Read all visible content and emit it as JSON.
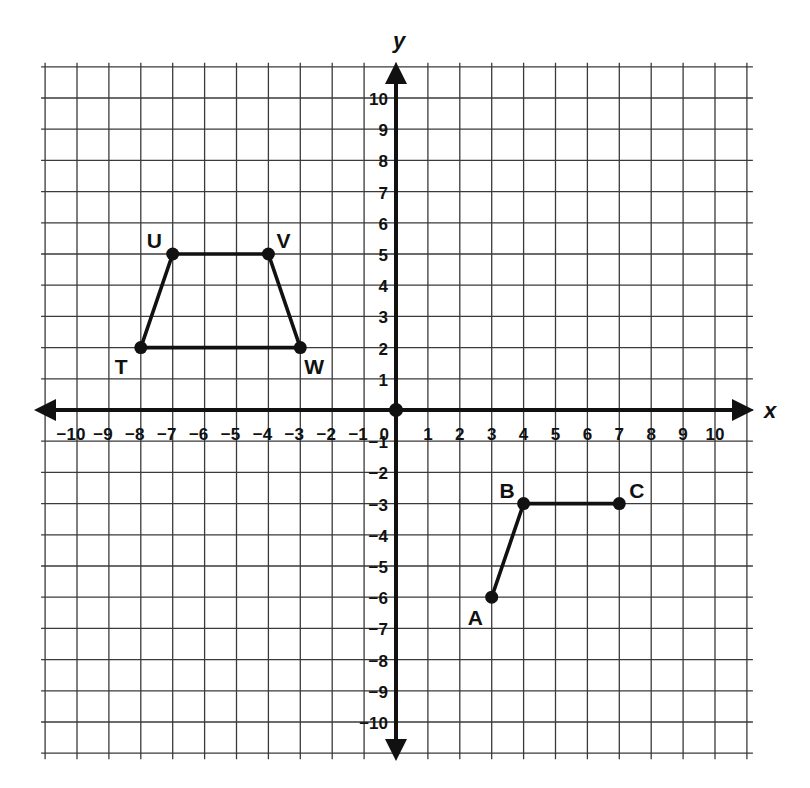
{
  "plane": {
    "x_axis_label": "x",
    "y_axis_label": "y",
    "x_range": [
      -10,
      10
    ],
    "y_range": [
      -10,
      10
    ],
    "grid_extent": 11,
    "origin_label": "0",
    "x_ticks": [
      "-10",
      "-9",
      "-8",
      "-7",
      "-6",
      "-5",
      "-4",
      "-3",
      "-2",
      "-1",
      "1",
      "2",
      "3",
      "4",
      "5",
      "6",
      "7",
      "8",
      "9",
      "10"
    ],
    "y_ticks": [
      "10",
      "9",
      "8",
      "7",
      "6",
      "5",
      "4",
      "3",
      "2",
      "1",
      "-1",
      "-2",
      "-3",
      "-4",
      "-5",
      "-6",
      "-7",
      "-8",
      "-9",
      "-10"
    ]
  },
  "figures": [
    {
      "name": "trapezoid TUVW",
      "closed": true,
      "points": [
        {
          "label": "T",
          "x": -8,
          "y": 2,
          "label_dx": -26,
          "label_dy": 26
        },
        {
          "label": "U",
          "x": -7,
          "y": 5,
          "label_dx": -26,
          "label_dy": -6
        },
        {
          "label": "V",
          "x": -4,
          "y": 5,
          "label_dx": 8,
          "label_dy": -6
        },
        {
          "label": "W",
          "x": -3,
          "y": 2,
          "label_dx": 4,
          "label_dy": 26
        }
      ]
    },
    {
      "name": "path ABC",
      "closed": false,
      "points": [
        {
          "label": "A",
          "x": 3,
          "y": -6,
          "label_dx": -24,
          "label_dy": 28
        },
        {
          "label": "B",
          "x": 4,
          "y": -3,
          "label_dx": -24,
          "label_dy": -6
        },
        {
          "label": "C",
          "x": 7,
          "y": -3,
          "label_dx": 10,
          "label_dy": -6
        }
      ]
    }
  ],
  "colors": {
    "grid": "#3a3a3a",
    "axis": "#111111",
    "background": "#ffffff"
  }
}
